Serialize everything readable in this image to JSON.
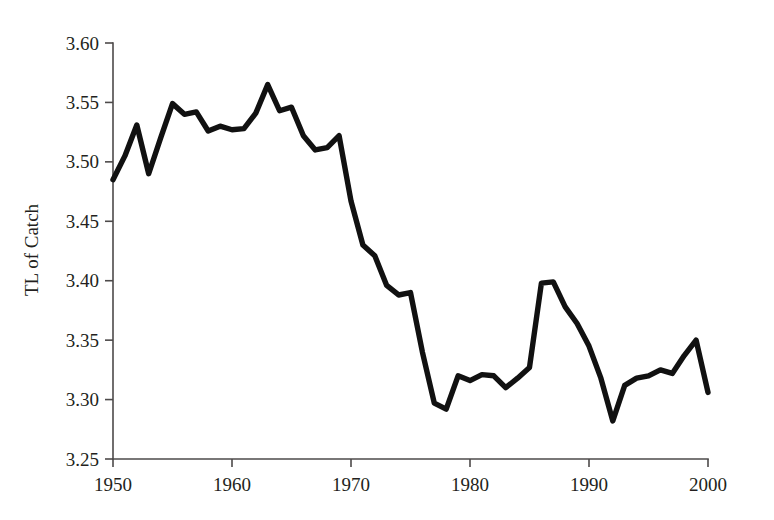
{
  "chart_data": {
    "type": "line",
    "title": "",
    "xlabel": "",
    "ylabel": "TL of Catch",
    "xlim": [
      1950,
      2000
    ],
    "ylim": [
      3.25,
      3.6
    ],
    "grid": false,
    "legend": null,
    "xticks": [
      1950,
      1960,
      1970,
      1980,
      1990,
      2000
    ],
    "xtick_labels": [
      "1950",
      "1960",
      "1970",
      "1980",
      "1990",
      "2000"
    ],
    "yticks": [
      3.25,
      3.3,
      3.35,
      3.4,
      3.45,
      3.5,
      3.55,
      3.6
    ],
    "ytick_labels": [
      "3.25",
      "3.30",
      "3.35",
      "3.40",
      "3.45",
      "3.50",
      "3.55",
      "3.60"
    ],
    "series": [
      {
        "name": "TL of Catch",
        "color": "#111111",
        "x": [
          1950,
          1951,
          1952,
          1953,
          1954,
          1955,
          1956,
          1957,
          1958,
          1959,
          1960,
          1961,
          1962,
          1963,
          1964,
          1965,
          1966,
          1967,
          1968,
          1969,
          1970,
          1971,
          1972,
          1973,
          1974,
          1975,
          1976,
          1977,
          1978,
          1979,
          1980,
          1981,
          1982,
          1983,
          1984,
          1985,
          1986,
          1987,
          1988,
          1989,
          1990,
          1991,
          1992,
          1993,
          1994,
          1995,
          1996,
          1997,
          1998,
          1999,
          2000
        ],
        "values": [
          3.485,
          3.505,
          3.531,
          3.49,
          3.52,
          3.549,
          3.54,
          3.542,
          3.526,
          3.53,
          3.527,
          3.528,
          3.541,
          3.565,
          3.543,
          3.546,
          3.522,
          3.51,
          3.512,
          3.522,
          3.467,
          3.43,
          3.421,
          3.396,
          3.388,
          3.39,
          3.34,
          3.297,
          3.292,
          3.32,
          3.316,
          3.321,
          3.32,
          3.31,
          3.318,
          3.327,
          3.398,
          3.399,
          3.378,
          3.364,
          3.345,
          3.318,
          3.282,
          3.312,
          3.318,
          3.32,
          3.325,
          3.322,
          3.337,
          3.35,
          3.306
        ]
      }
    ]
  }
}
